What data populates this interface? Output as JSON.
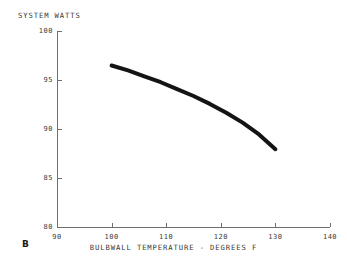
{
  "chart_data": {
    "type": "line",
    "title": "SYSTEM WATTS",
    "xlabel": "BULBWALL TEMPERATURE - DEGREES F",
    "ylabel": "SYSTEM WATTS",
    "xlim": [
      90,
      140
    ],
    "ylim": [
      80,
      100
    ],
    "xticks": [
      90,
      100,
      110,
      120,
      130,
      140
    ],
    "yticks": [
      80,
      85,
      90,
      95,
      100
    ],
    "grid": false,
    "legend": null,
    "line_color": "#141414",
    "line_width_px": 4,
    "series": [
      {
        "name": "system watts vs bulbwall temperature",
        "x": [
          100,
          103,
          106,
          109,
          112,
          115,
          118,
          121,
          124,
          127,
          130
        ],
        "y": [
          96.5,
          96.0,
          95.4,
          94.8,
          94.1,
          93.4,
          92.6,
          91.7,
          90.7,
          89.5,
          88.0
        ]
      }
    ],
    "annotations": [
      {
        "name": "figure-marker",
        "text": "B"
      }
    ]
  },
  "axes": {
    "y_title": "SYSTEM WATTS",
    "x_title": "BULBWALL TEMPERATURE - DEGREES F",
    "y_tick_labels": [
      "100",
      "95",
      "90",
      "85",
      "80"
    ],
    "x_tick_labels": [
      "90",
      "100",
      "110",
      "120",
      "130",
      "140"
    ]
  },
  "figure": {
    "marker_label": "B"
  }
}
